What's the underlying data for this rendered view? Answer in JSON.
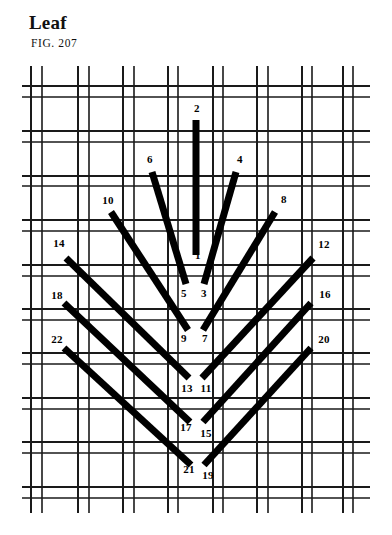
{
  "title": "Leaf",
  "figure_label": "FIG. 207",
  "colors": {
    "ink": "#000000",
    "paper": "#ffffff",
    "grid": "#1a1a1a",
    "stitch": "#000000"
  },
  "canvas": {
    "x": 22,
    "y": 62,
    "width": 348,
    "height": 455,
    "description": "even-weave canvas mesh drawn as paired warp and weft threads"
  },
  "grid": {
    "vertical_pairs": [
      [
        31,
        42
      ],
      [
        78,
        89
      ],
      [
        123,
        134
      ],
      [
        168,
        178
      ],
      [
        213,
        223
      ],
      [
        257,
        268
      ],
      [
        302,
        312
      ],
      [
        343,
        353
      ]
    ],
    "horizontal_pairs": [
      [
        86,
        97
      ],
      [
        131,
        142
      ],
      [
        176,
        186
      ],
      [
        220,
        231
      ],
      [
        265,
        276
      ],
      [
        309,
        320
      ],
      [
        353,
        364
      ],
      [
        398,
        409
      ],
      [
        442,
        453
      ],
      [
        487,
        498
      ]
    ],
    "tick_top": 66,
    "tick_bottom": 513
  },
  "stitches": [
    {
      "id": "s1",
      "from_label": "2",
      "to_label": "1",
      "x1": 196,
      "y1": 120,
      "x2": 196,
      "y2": 255,
      "width": 7
    },
    {
      "id": "s2",
      "from_label": "6",
      "to_label": "5",
      "x1": 152,
      "y1": 172,
      "x2": 186,
      "y2": 284,
      "width": 7
    },
    {
      "id": "s3",
      "from_label": "4",
      "to_label": "3",
      "x1": 236,
      "y1": 172,
      "x2": 204,
      "y2": 284,
      "width": 7
    },
    {
      "id": "s4",
      "from_label": "10",
      "to_label": "9",
      "x1": 111,
      "y1": 212,
      "x2": 188,
      "y2": 330,
      "width": 7
    },
    {
      "id": "s5",
      "from_label": "8",
      "to_label": "7",
      "x1": 275,
      "y1": 212,
      "x2": 203,
      "y2": 330,
      "width": 7
    },
    {
      "id": "s6",
      "from_label": "14",
      "to_label": "13",
      "x1": 66,
      "y1": 258,
      "x2": 189,
      "y2": 378,
      "width": 7
    },
    {
      "id": "s7",
      "from_label": "12",
      "to_label": "11",
      "x1": 313,
      "y1": 258,
      "x2": 202,
      "y2": 378,
      "width": 7
    },
    {
      "id": "s8",
      "from_label": "18",
      "to_label": "17",
      "x1": 64,
      "y1": 303,
      "x2": 190,
      "y2": 422,
      "width": 7
    },
    {
      "id": "s9",
      "from_label": "16",
      "to_label": "15",
      "x1": 311,
      "y1": 303,
      "x2": 203,
      "y2": 422,
      "width": 7
    },
    {
      "id": "s10",
      "from_label": "22",
      "to_label": "21",
      "x1": 64,
      "y1": 348,
      "x2": 191,
      "y2": 465,
      "width": 7
    },
    {
      "id": "s11",
      "from_label": "20",
      "to_label": "19",
      "x1": 311,
      "y1": 348,
      "x2": 204,
      "y2": 465,
      "width": 7
    }
  ],
  "number_labels": [
    {
      "text": "2",
      "x": 197,
      "y": 108
    },
    {
      "text": "6",
      "x": 150,
      "y": 159
    },
    {
      "text": "4",
      "x": 240,
      "y": 159
    },
    {
      "text": "10",
      "x": 108,
      "y": 200
    },
    {
      "text": "8",
      "x": 284,
      "y": 199
    },
    {
      "text": "1",
      "x": 198,
      "y": 255
    },
    {
      "text": "14",
      "x": 59,
      "y": 243
    },
    {
      "text": "12",
      "x": 324,
      "y": 244
    },
    {
      "text": "5",
      "x": 184,
      "y": 293
    },
    {
      "text": "3",
      "x": 204,
      "y": 293
    },
    {
      "text": "18",
      "x": 57,
      "y": 295
    },
    {
      "text": "16",
      "x": 325,
      "y": 294
    },
    {
      "text": "9",
      "x": 184,
      "y": 338
    },
    {
      "text": "7",
      "x": 205,
      "y": 338
    },
    {
      "text": "22",
      "x": 57,
      "y": 339
    },
    {
      "text": "20",
      "x": 324,
      "y": 339
    },
    {
      "text": "13",
      "x": 187,
      "y": 388
    },
    {
      "text": "11",
      "x": 206,
      "y": 388
    },
    {
      "text": "17",
      "x": 186,
      "y": 427
    },
    {
      "text": "15",
      "x": 206,
      "y": 433
    },
    {
      "text": "21",
      "x": 189,
      "y": 469
    },
    {
      "text": "19",
      "x": 208,
      "y": 475
    }
  ]
}
